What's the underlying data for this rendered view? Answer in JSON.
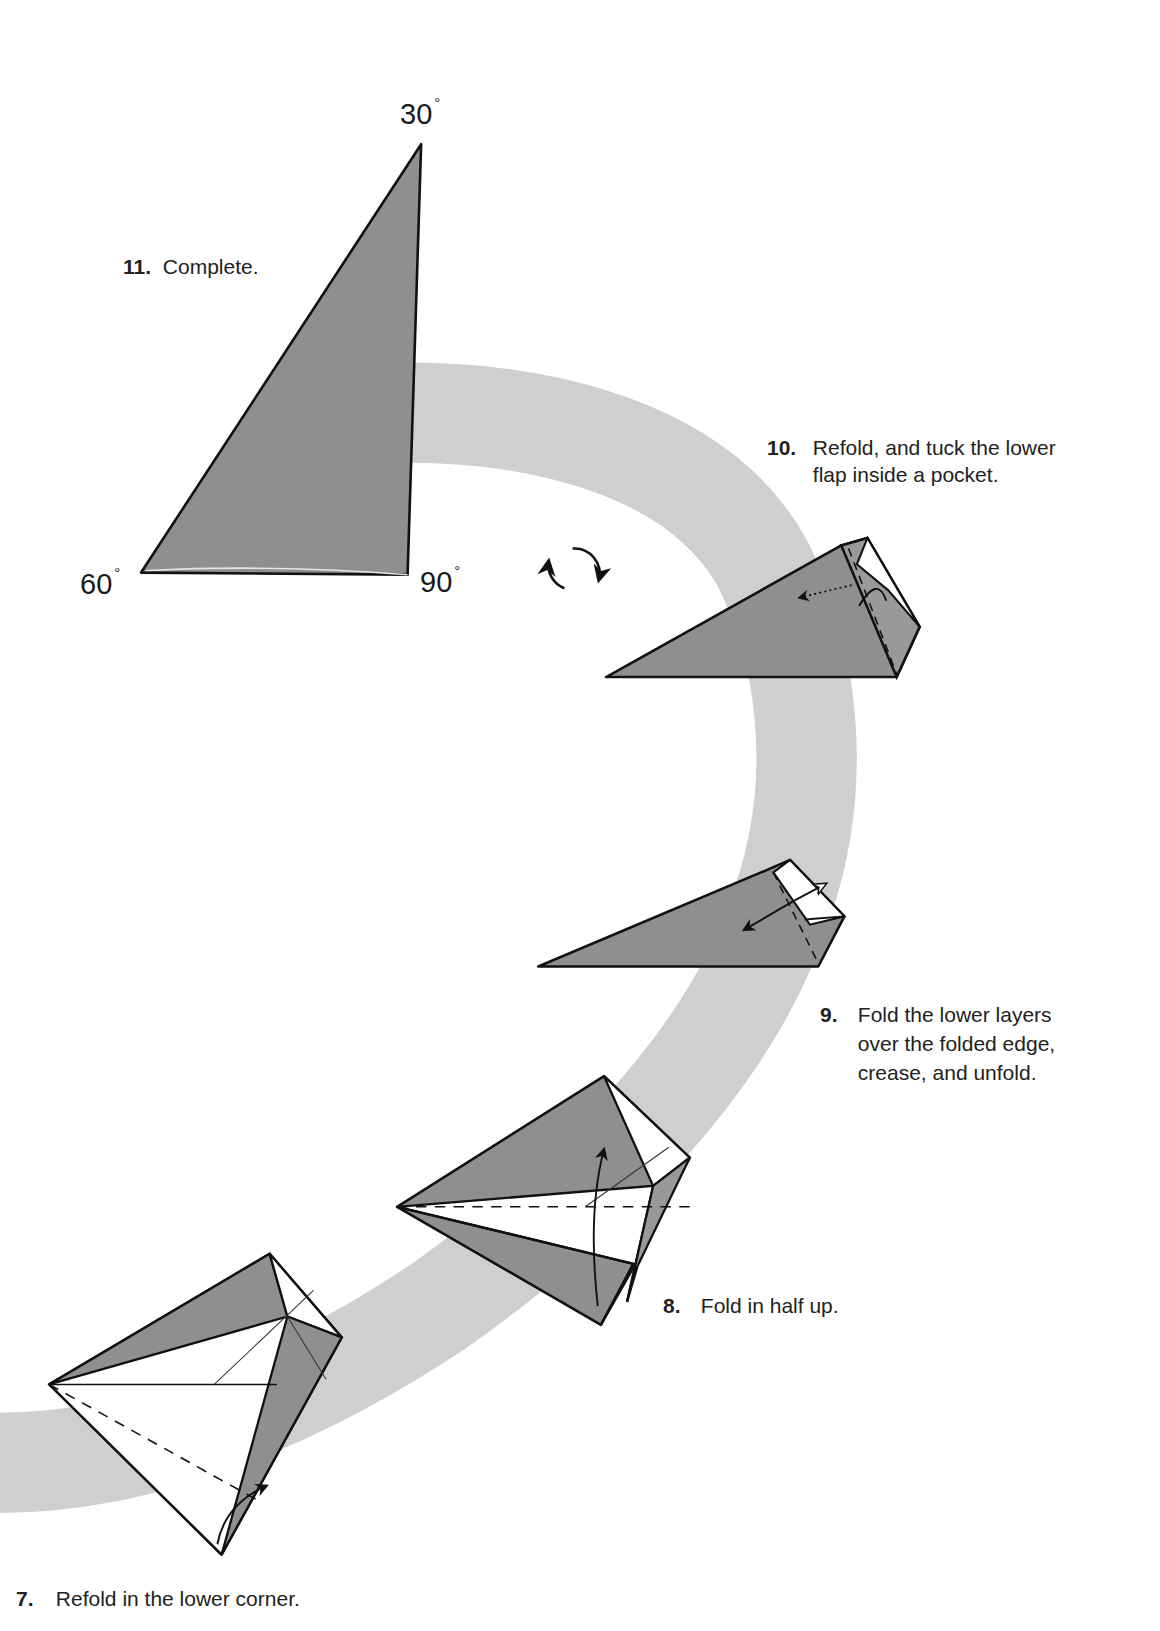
{
  "colors": {
    "background": "#ffffff",
    "band": "#cfcfcf",
    "paper_colored": "#8e8e8e",
    "paper_white": "#ffffff",
    "line": "#111111"
  },
  "steps": [
    {
      "number": "7.",
      "text": "Refold in the lower corner."
    },
    {
      "number": "8.",
      "text": "Fold in half up."
    },
    {
      "number": "9.",
      "text": "Fold the lower layers over the folded edge, crease, and unfold.",
      "lines": [
        "Fold the lower layers",
        "over the folded edge,",
        "crease, and unfold."
      ]
    },
    {
      "number": "10.",
      "text": "Refold, and tuck the lower flap inside a pocket.",
      "lines": [
        "Refold, and tuck the lower",
        "flap inside a pocket."
      ]
    },
    {
      "number": "11.",
      "text": "Complete."
    }
  ],
  "angles": {
    "top": {
      "value": "30",
      "unit": "°"
    },
    "left": {
      "value": "60",
      "unit": "°"
    },
    "right": {
      "value": "90",
      "unit": "°"
    }
  },
  "symbols": {
    "turn_over": "turn-over-arrows-icon"
  }
}
